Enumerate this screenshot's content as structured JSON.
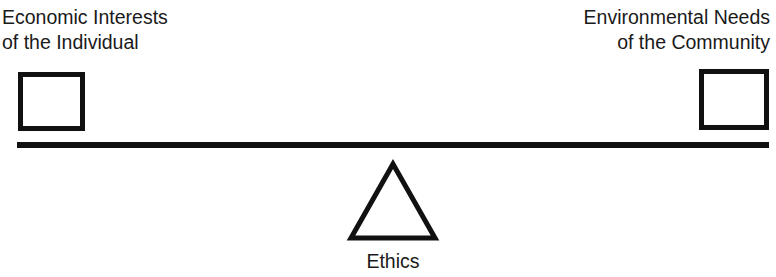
{
  "diagram": {
    "type": "balance-scale",
    "left": {
      "label_lines": [
        "Economic Interests",
        "of the Individual"
      ],
      "shape": "square"
    },
    "right": {
      "label_lines": [
        "Environmental Needs",
        "of the Community"
      ],
      "shape": "square"
    },
    "fulcrum": {
      "label": "Ethics",
      "shape": "triangle"
    },
    "beam": {
      "shape": "horizontal-bar"
    },
    "colors": {
      "stroke": "#111111",
      "background": "#ffffff",
      "text": "#1a1a1a"
    }
  }
}
